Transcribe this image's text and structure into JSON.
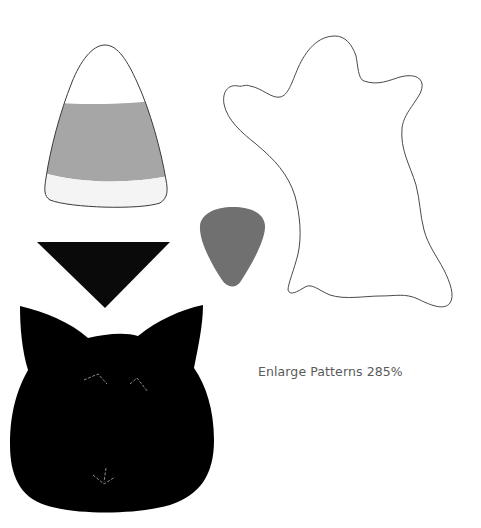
{
  "page": {
    "caption": "Enlarge Patterns 285%"
  },
  "patterns": [
    {
      "name": "candy-corn",
      "colors": {
        "tip": "#ffffff",
        "middle": "#a6a6a6",
        "base": "#f4f4f4",
        "outline": "#3a3a3a"
      }
    },
    {
      "name": "triangle",
      "color": "#0a0a0a"
    },
    {
      "name": "candy-corn-small",
      "color": "#707070"
    },
    {
      "name": "ghost",
      "outline": "#4a4a4a",
      "fill": "#ffffff"
    },
    {
      "name": "cat-head",
      "color": "#000000",
      "stitch_color": "#9a9a9a"
    }
  ]
}
